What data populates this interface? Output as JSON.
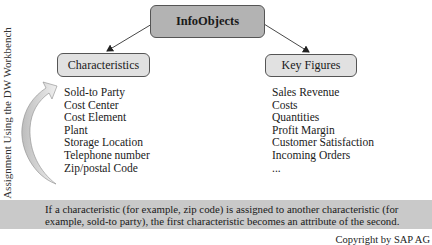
{
  "diagram": {
    "root": {
      "label": "InfoObjects"
    },
    "children": [
      {
        "label": "Characteristics",
        "items": [
          "Sold-to Party",
          "Cost Center",
          "Cost Element",
          "Plant",
          "Storage Location",
          "Telephone number",
          "Zip/postal Code"
        ]
      },
      {
        "label": "Key Figures",
        "items": [
          "Sales Revenue",
          "Costs",
          "Quantities",
          "Profit Margin",
          "Customer Satisfaction",
          "Incoming Orders",
          "..."
        ]
      }
    ],
    "side_label": "Assignment Using the DW Workbench",
    "note": {
      "line1": "If a characteristic (for example, zip code) is assigned to another characteristic (for",
      "line2": "example, sold-to party), the first characteristic becomes an attribute of the second."
    },
    "copyright": "Copyright by SAP AG"
  },
  "colors": {
    "root_fill": "#b3b3b3",
    "child_fill": "#e1e1e1",
    "band_fill": "#c9c9c9",
    "arrow_fill": "#d8d8d8"
  }
}
